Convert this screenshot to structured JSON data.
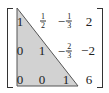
{
  "matrix": {
    "description": "Augmented matrix in row echelon form with lower-left triangle shaded",
    "highlight_color": "#d2d2d2",
    "rows": [
      [
        {
          "v": "1"
        },
        {
          "sign": "",
          "num": "1",
          "den": "2"
        },
        {
          "sign": "−",
          "num": "1",
          "den": "3"
        },
        {
          "v": "2"
        }
      ],
      [
        {
          "v": "0"
        },
        {
          "v": "1"
        },
        {
          "sign": "−",
          "num": "2",
          "den": "3"
        },
        {
          "v": "−2"
        }
      ],
      [
        {
          "v": "0"
        },
        {
          "v": "0"
        },
        {
          "v": "1"
        },
        {
          "v": "6"
        }
      ]
    ],
    "cells": {
      "r0c0": "1",
      "r0c1_num": "1",
      "r0c1_den": "2",
      "r0c2_sign": "−",
      "r0c2_num": "1",
      "r0c2_den": "3",
      "r0c3": "2",
      "r1c0": "0",
      "r1c1": "1",
      "r1c2_sign": "−",
      "r1c2_num": "2",
      "r1c2_den": "3",
      "r1c3": "−2",
      "r2c0": "0",
      "r2c1": "0",
      "r2c2": "1",
      "r2c3": "6"
    }
  }
}
